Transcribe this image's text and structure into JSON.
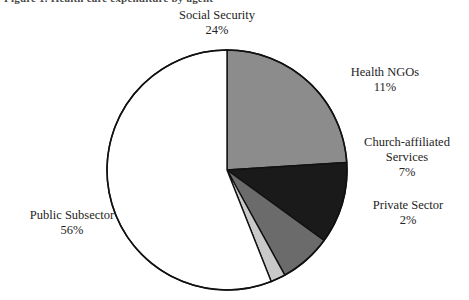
{
  "figure": {
    "title_remnant": "Figure 1. Health care expenditure by agent",
    "background_color": "#ffffff"
  },
  "chart_data": {
    "type": "pie",
    "title": "",
    "xlabel": "",
    "ylabel": "",
    "legend_position": "none",
    "grid": false,
    "labels_position": "outside",
    "start_angle_deg": 0,
    "direction": "clockwise",
    "categories": [
      "Social Security",
      "Health NGOs",
      "Church-affiliated Services",
      "Private Sector",
      "Public Subsector"
    ],
    "values": [
      24,
      11,
      7,
      2,
      56
    ],
    "value_labels": [
      "24%",
      "11%",
      "7%",
      "2%",
      "56%"
    ],
    "unit": "%",
    "colors": [
      "#8c8c8c",
      "#1a1a1a",
      "#6b6b6b",
      "#c9c9c9",
      "#ffffff"
    ],
    "slices": [
      {
        "name": "Social Security",
        "value": 24,
        "value_label": "24%",
        "color": "#8c8c8c",
        "label_lines": [
          "Social Security",
          "24%"
        ]
      },
      {
        "name": "Health NGOs",
        "value": 11,
        "value_label": "11%",
        "color": "#1a1a1a",
        "label_lines": [
          "Health NGOs",
          "11%"
        ]
      },
      {
        "name": "Church-affiliated Services",
        "value": 7,
        "value_label": "7%",
        "color": "#6b6b6b",
        "label_lines": [
          "Church-affiliated",
          "Services",
          "7%"
        ]
      },
      {
        "name": "Private Sector",
        "value": 2,
        "value_label": "2%",
        "color": "#c9c9c9",
        "label_lines": [
          "Private Sector",
          "2%"
        ]
      },
      {
        "name": "Public Subsector",
        "value": 56,
        "value_label": "56%",
        "color": "#ffffff",
        "label_lines": [
          "Public Subsector",
          "56%"
        ]
      }
    ],
    "outline_color": "#111111"
  },
  "labels": {
    "social_security": {
      "name": "Social Security",
      "pct": "24%"
    },
    "health_ngos": {
      "name": "Health NGOs",
      "pct": "11%"
    },
    "church": {
      "name_line1": "Church-affiliated",
      "name_line2": "Services",
      "pct": "7%"
    },
    "private_sector": {
      "name": "Private Sector",
      "pct": "2%"
    },
    "public_subsector": {
      "name": "Public Subsector",
      "pct": "56%"
    }
  }
}
